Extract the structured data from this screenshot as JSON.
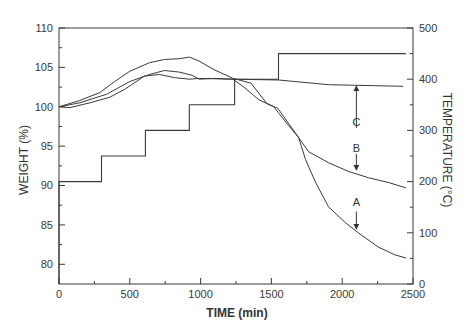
{
  "figure": {
    "xlabel": "TIME (min)",
    "ylabel_left": "WEIGHT (%)",
    "ylabel_right": "TEMPERATURE (°C)"
  },
  "chart_data": {
    "type": "line",
    "title": "",
    "xlabel": "TIME (min)",
    "ylabel": "WEIGHT (%)",
    "y2label": "TEMPERATURE (°C)",
    "xlim": [
      0,
      2500
    ],
    "ylim": [
      77.5,
      110
    ],
    "y2lim": [
      0,
      500
    ],
    "xticks": [
      0,
      500,
      1000,
      1500,
      2000,
      2500
    ],
    "xminor_step": 250,
    "yticks": [
      80,
      85,
      90,
      95,
      100,
      105,
      110
    ],
    "yminor_step": 2.5,
    "y2ticks": [
      0,
      100,
      200,
      300,
      400,
      500
    ],
    "y2minor_step": 50,
    "grid": false,
    "legend": null,
    "series": [
      {
        "name": "A",
        "axis": "left",
        "points": [
          [
            0,
            100.0
          ],
          [
            147,
            100.8
          ],
          [
            288,
            101.8
          ],
          [
            393,
            103.2
          ],
          [
            499,
            104.5
          ],
          [
            639,
            105.6
          ],
          [
            744,
            106.0
          ],
          [
            850,
            106.1
          ],
          [
            920,
            106.3
          ],
          [
            990,
            105.8
          ],
          [
            1095,
            104.7
          ],
          [
            1229,
            103.6
          ],
          [
            1355,
            103.0
          ],
          [
            1468,
            100.4
          ],
          [
            1545,
            99.8
          ],
          [
            1692,
            96.1
          ],
          [
            1741,
            93.3
          ],
          [
            1812,
            90.4
          ],
          [
            1903,
            87.3
          ],
          [
            2022,
            85.3
          ],
          [
            2114,
            84.0
          ],
          [
            2254,
            82.2
          ],
          [
            2373,
            81.2
          ],
          [
            2451,
            80.8
          ]
        ]
      },
      {
        "name": "B",
        "axis": "left",
        "points": [
          [
            0,
            100.0
          ],
          [
            147,
            100.5
          ],
          [
            337,
            101.6
          ],
          [
            499,
            103.2
          ],
          [
            639,
            104.1
          ],
          [
            744,
            104.6
          ],
          [
            850,
            104.4
          ],
          [
            941,
            104.0
          ],
          [
            990,
            103.5
          ],
          [
            1095,
            103.6
          ],
          [
            1229,
            103.5
          ],
          [
            1306,
            102.5
          ],
          [
            1411,
            100.9
          ],
          [
            1517,
            100.0
          ],
          [
            1622,
            97.6
          ],
          [
            1692,
            96.1
          ],
          [
            1763,
            94.3
          ],
          [
            1903,
            92.9
          ],
          [
            2043,
            91.8
          ],
          [
            2184,
            91.0
          ],
          [
            2324,
            90.4
          ],
          [
            2451,
            89.7
          ]
        ]
      },
      {
        "name": "C",
        "axis": "left",
        "points": [
          [
            0,
            100.0
          ],
          [
            77,
            99.9
          ],
          [
            218,
            100.5
          ],
          [
            358,
            101.2
          ],
          [
            463,
            102.2
          ],
          [
            604,
            103.9
          ],
          [
            709,
            104.1
          ],
          [
            815,
            103.7
          ],
          [
            920,
            103.5
          ],
          [
            990,
            103.6
          ],
          [
            1236,
            103.5
          ],
          [
            1552,
            103.4
          ],
          [
            1903,
            102.8
          ],
          [
            2430,
            102.6
          ]
        ]
      },
      {
        "name": "Temperature",
        "axis": "right",
        "points": [
          [
            0,
            0
          ],
          [
            0,
            200
          ],
          [
            300,
            200
          ],
          [
            300,
            250
          ],
          [
            610,
            250
          ],
          [
            610,
            300
          ],
          [
            920,
            300
          ],
          [
            920,
            350
          ],
          [
            1240,
            350
          ],
          [
            1240,
            400
          ],
          [
            1550,
            400
          ],
          [
            1550,
            450
          ],
          [
            2450,
            450
          ]
        ]
      }
    ],
    "annotations": [
      {
        "text": "C",
        "x": 2100,
        "label_y": 98.0,
        "arrow_from": 97.3,
        "arrow_to": 102.6
      },
      {
        "text": "B",
        "x": 2100,
        "label_y": 94.7,
        "arrow_from": 94.0,
        "arrow_to": 92.0
      },
      {
        "text": "A",
        "x": 2100,
        "label_y": 87.9,
        "arrow_from": 86.7,
        "arrow_to": 84.5
      }
    ]
  }
}
